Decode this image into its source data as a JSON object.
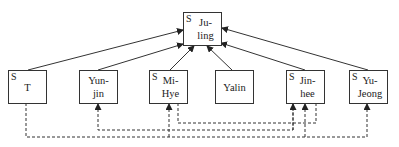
{
  "diagram": {
    "root": {
      "id": "ju-ling",
      "lines": [
        "Ju-",
        "ling"
      ],
      "marker": "S"
    },
    "nodes": [
      {
        "id": "t",
        "lines": [
          "T"
        ],
        "marker": "S"
      },
      {
        "id": "yun-jin",
        "lines": [
          "Yun-",
          "jin"
        ],
        "marker": ""
      },
      {
        "id": "mi-hye",
        "lines": [
          "Mi-",
          "Hye"
        ],
        "marker": "S"
      },
      {
        "id": "yalin",
        "lines": [
          "Yalin"
        ],
        "marker": ""
      },
      {
        "id": "jin-hee",
        "lines": [
          "Jin-",
          "hee"
        ],
        "marker": "S"
      },
      {
        "id": "yu-jeong",
        "lines": [
          "Yu-",
          "Jeong"
        ],
        "marker": "S"
      }
    ],
    "solid_edges": [
      {
        "from": "t",
        "to": "ju-ling"
      },
      {
        "from": "yun-jin",
        "to": "ju-ling"
      },
      {
        "from": "mi-hye",
        "to": "ju-ling"
      },
      {
        "from": "yalin",
        "to": "ju-ling"
      },
      {
        "from": "jin-hee",
        "to": "ju-ling"
      },
      {
        "from": "yu-jeong",
        "to": "ju-ling"
      }
    ],
    "dashed_edges": [
      {
        "from": "t",
        "to": "yu-jeong"
      },
      {
        "from": "t",
        "to": "mi-hye"
      },
      {
        "from": "t",
        "to": "jin-hee"
      },
      {
        "from": "jin-hee",
        "to": "yun-jin"
      },
      {
        "from": "mi-hye",
        "to": "jin-hee"
      }
    ]
  }
}
